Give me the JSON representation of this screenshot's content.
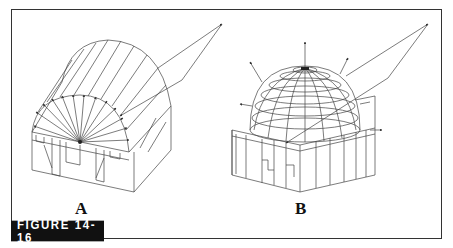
{
  "figure": {
    "tag": "FIGURE 14-16",
    "panels": [
      {
        "label": "A",
        "description": "Half-cylinder vaulted structure over a rectangular base with interior walls; radial arrows emanate from a central point to the vault surface; a reflected ray path extends to the upper right."
      },
      {
        "label": "B",
        "description": "Hemispherical dome with latitude/longitude wireframe over a square base with partitions; outward normal arrows on dome; a reflected ray path extends to the upper right."
      }
    ],
    "colors": {
      "line": "#333333",
      "tag_bg": "#111111",
      "tag_fg": "#ffffff",
      "background": "#ffffff"
    }
  }
}
